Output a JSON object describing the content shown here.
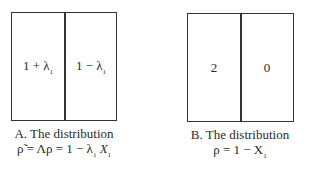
{
  "panels": [
    {
      "id": "A",
      "cells": [
        {
          "label": "1 + λ",
          "sub": "1"
        },
        {
          "label": "1 − λ",
          "sub": "1"
        }
      ],
      "caption_line1": "A. The distribution",
      "caption_line2_pre": "ρ̃ = Λρ = 1 − λ",
      "caption_line2_sub1": "1",
      "caption_line2_mid": "X",
      "caption_line2_sub2": "1"
    },
    {
      "id": "B",
      "cells": [
        {
          "label": "2",
          "sub": ""
        },
        {
          "label": "0",
          "sub": ""
        }
      ],
      "caption_line1": "B. The distribution",
      "caption_line2_pre": "ρ = 1 − X",
      "caption_line2_sub1": "1"
    }
  ],
  "colors": {
    "line": "#333333",
    "text": "#2a2a2a",
    "background": "#ffffff"
  }
}
